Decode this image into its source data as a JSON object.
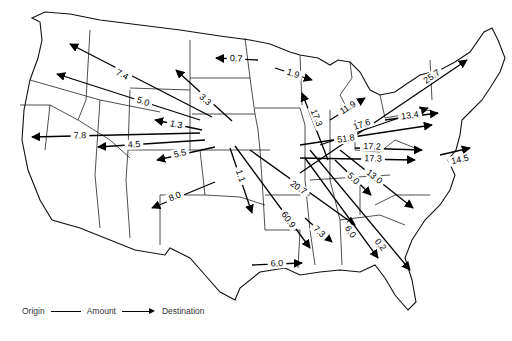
{
  "map": {
    "title": "",
    "legend": {
      "origin": "Origin",
      "amount": "Amount",
      "destination": "Destination"
    },
    "flows": [
      {
        "amount": "0.7",
        "from": [
          258,
          60
        ],
        "to": [
          216,
          58
        ],
        "label_at": [
          236,
          59
        ]
      },
      {
        "amount": "7.4",
        "from": [
          212,
          117
        ],
        "to": [
          70,
          44
        ],
        "label_at": [
          122,
          75
        ]
      },
      {
        "amount": "3.3",
        "from": [
          232,
          121
        ],
        "to": [
          176,
          70
        ],
        "label_at": [
          205,
          100
        ]
      },
      {
        "amount": "5.0",
        "from": [
          200,
          120
        ],
        "to": [
          57,
          74
        ],
        "label_at": [
          143,
          102
        ]
      },
      {
        "amount": "1.3",
        "from": [
          202,
          130
        ],
        "to": [
          155,
          120
        ],
        "label_at": [
          176,
          125
        ]
      },
      {
        "amount": "7.8",
        "from": [
          200,
          133
        ],
        "to": [
          32,
          137
        ],
        "label_at": [
          80,
          136
        ]
      },
      {
        "amount": "4.5",
        "from": [
          205,
          140
        ],
        "to": [
          98,
          147
        ],
        "label_at": [
          134,
          145
        ]
      },
      {
        "amount": "5.5",
        "from": [
          215,
          147
        ],
        "to": [
          157,
          160
        ],
        "label_at": [
          180,
          154
        ]
      },
      {
        "amount": "8.0",
        "from": [
          215,
          182
        ],
        "to": [
          152,
          208
        ],
        "label_at": [
          175,
          197
        ]
      },
      {
        "amount": "1.1",
        "from": [
          230,
          148
        ],
        "to": [
          252,
          213
        ],
        "label_at": [
          240,
          176
        ]
      },
      {
        "amount": "60.9",
        "from": [
          235,
          146
        ],
        "to": [
          310,
          248
        ],
        "label_at": [
          288,
          220
        ]
      },
      {
        "amount": "20.7",
        "from": [
          250,
          150
        ],
        "to": [
          355,
          225
        ],
        "label_at": [
          298,
          188
        ]
      },
      {
        "amount": "7.3",
        "from": [
          305,
          218
        ],
        "to": [
          332,
          242
        ],
        "label_at": [
          319,
          232
        ]
      },
      {
        "amount": "6.0",
        "from": [
          252,
          265
        ],
        "to": [
          302,
          263
        ],
        "label_at": [
          277,
          264
        ]
      },
      {
        "amount": "6.0",
        "from": [
          305,
          158
        ],
        "to": [
          378,
          258
        ],
        "label_at": [
          350,
          232
        ]
      },
      {
        "amount": "0.2",
        "from": [
          310,
          150
        ],
        "to": [
          410,
          270
        ],
        "label_at": [
          380,
          245
        ]
      },
      {
        "amount": "5.0",
        "from": [
          335,
          160
        ],
        "to": [
          371,
          195
        ],
        "label_at": [
          353,
          179
        ]
      },
      {
        "amount": "13.0",
        "from": [
          340,
          150
        ],
        "to": [
          413,
          208
        ],
        "label_at": [
          374,
          177
        ]
      },
      {
        "amount": "1.9",
        "from": [
          275,
          68
        ],
        "to": [
          312,
          80
        ],
        "label_at": [
          293,
          74
        ]
      },
      {
        "amount": "17.3",
        "from": [
          328,
          160
        ],
        "to": [
          302,
          93
        ],
        "label_at": [
          316,
          118
        ]
      },
      {
        "amount": "11.9",
        "from": [
          330,
          120
        ],
        "to": [
          365,
          98
        ],
        "label_at": [
          348,
          108
        ]
      },
      {
        "amount": "25.7",
        "from": [
          300,
          173
        ],
        "to": [
          467,
          60
        ],
        "label_at": [
          432,
          77
        ]
      },
      {
        "amount": "17.6",
        "from": [
          320,
          145
        ],
        "to": [
          428,
          108
        ],
        "label_at": [
          362,
          125
        ]
      },
      {
        "amount": "13.4",
        "from": [
          385,
          120
        ],
        "to": [
          438,
          113
        ],
        "label_at": [
          410,
          116
        ]
      },
      {
        "amount": "51.8",
        "from": [
          300,
          145
        ],
        "to": [
          432,
          125
        ],
        "label_at": [
          346,
          139
        ]
      },
      {
        "amount": "17.2",
        "from": [
          355,
          148
        ],
        "to": [
          422,
          150
        ],
        "label_at": [
          372,
          147
        ]
      },
      {
        "amount": "17.3",
        "from": [
          300,
          158
        ],
        "to": [
          415,
          160
        ],
        "label_at": [
          373,
          159
        ]
      },
      {
        "amount": "14.5",
        "from": [
          440,
          155
        ],
        "to": [
          470,
          148
        ],
        "label_at": [
          460,
          160
        ]
      }
    ]
  }
}
